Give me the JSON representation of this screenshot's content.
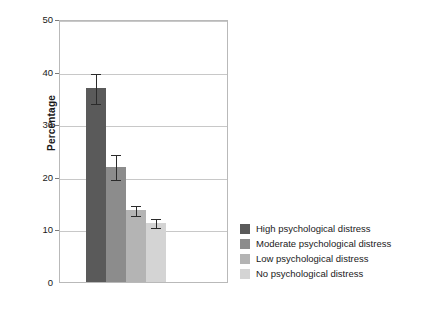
{
  "chart_data": {
    "type": "bar",
    "title": "",
    "xlabel": "",
    "ylabel": "Percentage",
    "ylim": [
      0,
      50
    ],
    "yticks": [
      0,
      10,
      20,
      30,
      40,
      50
    ],
    "ytick_labels": [
      "0",
      "10",
      "20",
      "30",
      "40",
      "50"
    ],
    "grid": true,
    "legend_position": "right",
    "categories": [
      "High psychological distress",
      "Moderate psychological distress",
      "Low psychological distress",
      "No psychological distress"
    ],
    "values": [
      36.8,
      21.8,
      13.6,
      11.3
    ],
    "errors_low": [
      34.0,
      19.6,
      12.7,
      10.5
    ],
    "errors_high": [
      40.0,
      24.5,
      14.8,
      12.3
    ],
    "colors": [
      "#5a5a5a",
      "#8c8c8c",
      "#b4b4b4",
      "#d4d4d4"
    ]
  },
  "axis": {
    "y_title": "Percentage"
  },
  "legend": {
    "items": [
      {
        "label": "High psychological distress",
        "color": "#5a5a5a"
      },
      {
        "label": "Moderate psychological distress",
        "color": "#8c8c8c"
      },
      {
        "label": "Low psychological distress",
        "color": "#b4b4b4"
      },
      {
        "label": "No psychological distress",
        "color": "#d4d4d4"
      }
    ]
  }
}
